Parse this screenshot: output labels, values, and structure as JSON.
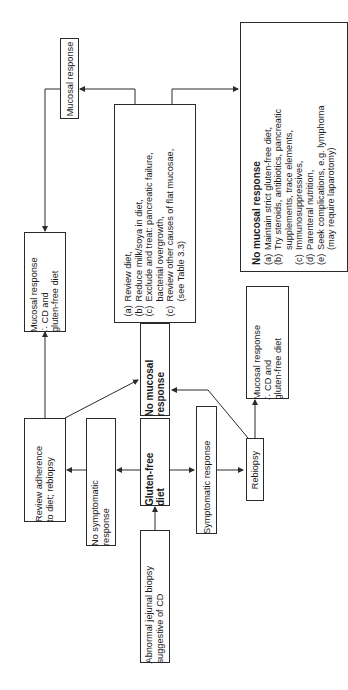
{
  "nodes": {
    "start": {
      "lines": [
        "Abnormal jejunal biopsy",
        "suggestive of CD"
      ]
    },
    "gfd": {
      "lines": [
        "Gluten-free",
        "diet"
      ]
    },
    "no_symptomatic": {
      "lines": [
        "No symptomatic",
        "response"
      ]
    },
    "symptomatic": {
      "lines": [
        "Symptomatic response"
      ]
    },
    "review_adherence": {
      "lines": [
        "Review adherence",
        "to diet; rebiopsy"
      ]
    },
    "no_mucosal_mid": {
      "lines": [
        "No mucosal",
        "response"
      ]
    },
    "rebiopsy": {
      "lines": [
        "Rebiopsy"
      ]
    },
    "mucosal_cd_right": {
      "lines": [
        "Mucosal response",
        "∴ CD and",
        "gluten-free diet"
      ]
    },
    "mucosal_cd_left": {
      "lines": [
        "Mucosal response",
        "∴ CD and",
        "gluten-free diet"
      ]
    },
    "mucosal_response_top": {
      "lines": [
        "Mucosal response"
      ]
    },
    "review_diet": {
      "items": [
        {
          "key": "(a)",
          "text": "Review diet,"
        },
        {
          "key": "(b)",
          "text": "Reduce milk/soya in diet,"
        },
        {
          "key": "(c)",
          "text": "Exclude and treat: pancreatic failure,"
        },
        {
          "key": "",
          "text": "bacterial overgrowth,"
        },
        {
          "key": "(c)",
          "text": "Review other causes of flat mucosae,"
        },
        {
          "key": "",
          "text": "(see Table 3.3)"
        }
      ]
    },
    "no_mucosal_final": {
      "title": "No mucosal response",
      "items": [
        {
          "key": "(a)",
          "text": "Maintain strict gluten-free diet,"
        },
        {
          "key": "(b)",
          "text": "Try steroids, antibiotics, pancreatic"
        },
        {
          "key": "",
          "text": "supplements, trace elements,"
        },
        {
          "key": "(c)",
          "text": "Immunosuppressives,"
        },
        {
          "key": "(d)",
          "text": "Parenteral nutrition,"
        },
        {
          "key": "(e)",
          "text": "Seek complications, e.g. lymphoma"
        },
        {
          "key": "",
          "text": "(may require laparotomy)"
        }
      ]
    }
  },
  "colors": {
    "line": "#2a2a2a",
    "background": "#ffffff"
  }
}
